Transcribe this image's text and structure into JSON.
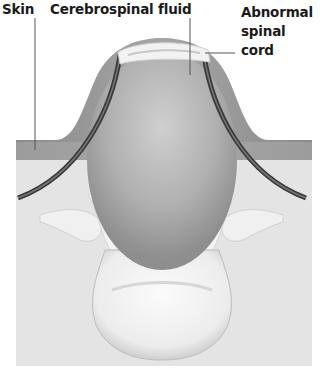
{
  "diagram": {
    "type": "medical-illustration",
    "labels": [
      {
        "id": "skin",
        "text": "Skin"
      },
      {
        "id": "csf",
        "text": "Cerebrospinal fluid"
      },
      {
        "id": "cord_line1",
        "text": "Abnormal"
      },
      {
        "id": "cord_line2",
        "text": "spinal"
      },
      {
        "id": "cord_line3",
        "text": "cord"
      }
    ]
  },
  "colors": {
    "background": "#ffffff",
    "tissue": "#e6e6e6",
    "skin_band": "#a8a8a8",
    "dome": "#9a9a9a",
    "sac": "#b5b5b5",
    "membrane": "#3a3a3a",
    "bone": "#f2f2f2",
    "cord": "#f0f0f0",
    "leader_line": "#555555",
    "text": "#1a1a1a"
  }
}
